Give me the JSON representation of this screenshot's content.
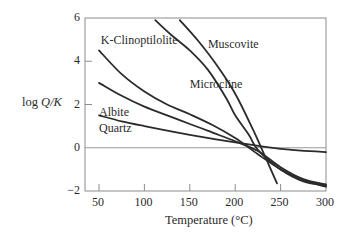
{
  "chart_data": {
    "type": "line",
    "title": "",
    "xlabel": "Temperature (°C)",
    "ylabel": "log Q/K",
    "ylabel_parts": {
      "prefix": "log ",
      "italic": "Q/K"
    },
    "xlim": [
      35,
      300
    ],
    "ylim": [
      -2,
      6
    ],
    "xticks": [
      50,
      100,
      150,
      200,
      250,
      300
    ],
    "yticks": [
      -2,
      0,
      2,
      4,
      6
    ],
    "ytick_labels": [
      "−2",
      "0",
      "2",
      "4",
      "6"
    ],
    "grid": false,
    "reference_line_y": 0,
    "legend": "inline labels",
    "series": [
      {
        "name": "K-Clinoptilolite",
        "x": [
          50,
          75,
          100,
          125,
          150,
          175,
          200,
          225,
          250,
          275,
          300
        ],
        "values": [
          4.5,
          3.4,
          2.6,
          2.0,
          1.55,
          1.05,
          0.45,
          -0.3,
          -1.0,
          -1.5,
          -1.8
        ]
      },
      {
        "name": "Muscovite",
        "x": [
          139,
          160,
          180,
          200,
          220,
          235,
          246
        ],
        "values": [
          5.9,
          4.9,
          3.8,
          2.5,
          0.8,
          -0.6,
          -1.65
        ]
      },
      {
        "name": "Microcline",
        "x": [
          112,
          130,
          150,
          170,
          190,
          200,
          215,
          225,
          250,
          275,
          300
        ],
        "values": [
          5.9,
          5.2,
          4.5,
          3.6,
          2.3,
          1.5,
          0.6,
          -0.1,
          -1.0,
          -1.55,
          -1.75
        ]
      },
      {
        "name": "Albite",
        "x": [
          50,
          75,
          100,
          125,
          150,
          175,
          200,
          225,
          250,
          275,
          300
        ],
        "values": [
          3.0,
          2.4,
          1.9,
          1.5,
          1.1,
          0.7,
          0.3,
          -0.15,
          -0.9,
          -1.45,
          -1.7
        ]
      },
      {
        "name": "Quartz",
        "x": [
          50,
          75,
          100,
          150,
          200,
          250,
          300
        ],
        "values": [
          1.5,
          1.22,
          1.0,
          0.6,
          0.25,
          -0.05,
          -0.2
        ]
      }
    ],
    "annotations": [
      {
        "text": "K-Clinoptilolite",
        "x": 52,
        "y": 5.0
      },
      {
        "text": "Muscovite",
        "x": 170,
        "y": 4.8
      },
      {
        "text": "Microcline",
        "x": 150,
        "y": 2.95
      },
      {
        "text": "Albite",
        "x": 50,
        "y": 1.65
      },
      {
        "text": "Quartz",
        "x": 50,
        "y": 0.9
      }
    ]
  },
  "colors": {
    "line": "#2b2b2b",
    "axis": "#8c8c8c",
    "text": "#2a2a2a"
  }
}
